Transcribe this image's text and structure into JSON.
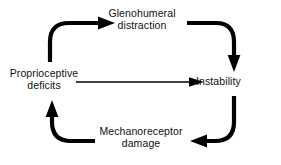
{
  "diagram": {
    "type": "cyclical-feedback-loop",
    "background_color": "#ffffff",
    "stroke_color": "#000000",
    "text_color": "#111111",
    "nodes": [
      {
        "id": "glenohumeral-distraction",
        "line1": "Glenohumeral",
        "line2": "distraction",
        "position": "top"
      },
      {
        "id": "proprioceptive-deficits",
        "line1": "Proprioceptive",
        "line2": "deficits",
        "position": "left"
      },
      {
        "id": "instability",
        "line1": "Instability",
        "line2": "",
        "position": "right"
      },
      {
        "id": "mechanoreceptor-damage",
        "line1": "Mechanoreceptor",
        "line2": "damage",
        "position": "bottom"
      }
    ],
    "arrows": [
      {
        "id": "proprioceptive-to-glenohumeral",
        "from": "proprioceptive-deficits",
        "to": "glenohumeral-distraction",
        "style": "thick-curved",
        "direction": "up-then-right"
      },
      {
        "id": "glenohumeral-to-instability",
        "from": "glenohumeral-distraction",
        "to": "instability",
        "style": "thick-curved",
        "direction": "right-then-down"
      },
      {
        "id": "instability-to-mechanoreceptor",
        "from": "instability",
        "to": "mechanoreceptor-damage",
        "style": "thick-curved",
        "direction": "down-then-left"
      },
      {
        "id": "mechanoreceptor-to-proprioceptive",
        "from": "mechanoreceptor-damage",
        "to": "proprioceptive-deficits",
        "style": "thick-curved",
        "direction": "left-then-up"
      },
      {
        "id": "proprioceptive-to-instability",
        "from": "proprioceptive-deficits",
        "to": "instability",
        "style": "thin-straight",
        "direction": "right"
      }
    ]
  }
}
